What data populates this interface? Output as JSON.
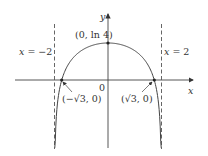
{
  "diagram": {
    "function": "y = ln(4 - x^2)",
    "axis_labels": {
      "x": "x",
      "y": "y",
      "origin": "0"
    },
    "asymptotes": [
      {
        "label_var": "x",
        "label_rest": " = −2",
        "x": -2
      },
      {
        "label_var": "x",
        "label_rest": " = 2",
        "x": 2
      }
    ],
    "points": [
      {
        "label": "(0, ln 4)",
        "x": 0,
        "y": 1.386
      },
      {
        "label": "(−√3, 0)",
        "x": -1.732,
        "y": 0
      },
      {
        "label": "(√3, 0)",
        "x": 1.732,
        "y": 0
      }
    ],
    "colors": {
      "curve": "#444444",
      "axes": "#444444",
      "asymptote": "#555555",
      "text": "#333333"
    }
  }
}
